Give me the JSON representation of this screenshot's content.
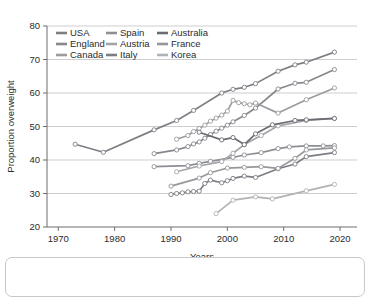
{
  "chart_data": {
    "type": "line",
    "title": "",
    "xlabel": "Years",
    "ylabel": "Proportion overweight",
    "xlim": [
      1968,
      2023
    ],
    "ylim": [
      20,
      80
    ],
    "xticks": [
      1970,
      1980,
      1990,
      2000,
      2010,
      2020
    ],
    "yticks": [
      20,
      30,
      40,
      50,
      60,
      70,
      80
    ],
    "grid": "horizontal",
    "legend_position": "top-left-inside",
    "legend_columns": 3,
    "series": [
      {
        "name": "USA",
        "color": "#7d7f84",
        "x": [
          1973,
          1978,
          1987,
          1991,
          1994,
          1999,
          2001,
          2003,
          2005,
          2009,
          2012,
          2014,
          2019
        ],
        "y": [
          44.7,
          42.3,
          49.0,
          51.8,
          54.8,
          60.0,
          61.1,
          61.7,
          62.8,
          66.5,
          68.4,
          69.2,
          72.2
        ]
      },
      {
        "name": "England",
        "color": "#86888d",
        "x": [
          1987,
          1991,
          1993,
          1994,
          1995,
          1996,
          1997,
          1998,
          1999,
          2000,
          2001,
          2003,
          2005,
          2009,
          2012,
          2014,
          2019
        ],
        "y": [
          41.9,
          43.0,
          44.0,
          44.8,
          45.4,
          46.5,
          47.6,
          48.6,
          49.5,
          50.4,
          51.4,
          53.3,
          55.5,
          61.2,
          62.9,
          63.2,
          67.0
        ]
      },
      {
        "name": "Canada",
        "color": "#9a9ca0",
        "x": [
          1991,
          1993,
          1994,
          1995,
          1996,
          1997,
          1998,
          1999,
          2000,
          2001,
          2002,
          2003,
          2004,
          2005,
          2009,
          2014,
          2019
        ],
        "y": [
          46.2,
          47.3,
          48.5,
          49.4,
          50.4,
          51.6,
          52.5,
          53.4,
          54.6,
          57.8,
          57.1,
          56.8,
          56.5,
          57.0,
          54.0,
          58.0,
          61.5
        ]
      },
      {
        "name": "Spain",
        "color": "#8d8f94",
        "x": [
          1987,
          1993,
          1995,
          1997,
          2001,
          2003,
          2006,
          2009,
          2011,
          2014,
          2017,
          2019
        ],
        "y": [
          38.0,
          38.3,
          39.0,
          39.6,
          40.8,
          41.5,
          42.2,
          43.4,
          43.9,
          44.2,
          44.2,
          44.3
        ]
      },
      {
        "name": "Austria",
        "color": "#a2a4a8",
        "x": [
          1991,
          1995,
          1999,
          2001,
          2003,
          2006,
          2009,
          2014,
          2019
        ],
        "y": [
          36.5,
          38.2,
          39.5,
          42.0,
          44.6,
          47.3,
          50.2,
          51.8,
          52.4
        ]
      },
      {
        "name": "Italy",
        "color": "#7b7d82",
        "x": [
          1990,
          1991,
          1992,
          1993,
          1994,
          1995,
          1996,
          1997,
          1999,
          2000,
          2001,
          2003,
          2005,
          2009,
          2012,
          2014,
          2019
        ],
        "y": [
          29.7,
          30.0,
          30.2,
          30.5,
          30.6,
          30.7,
          33.0,
          34.0,
          33.2,
          33.8,
          34.5,
          35.2,
          34.8,
          37.4,
          38.8,
          41.0,
          42.2
        ]
      },
      {
        "name": "Australia",
        "color": "#6a6c71",
        "x": [
          1995,
          1999,
          2001,
          2003,
          2005,
          2008,
          2012,
          2014,
          2019
        ],
        "y": [
          48.3,
          46.0,
          46.7,
          44.6,
          47.8,
          50.5,
          51.8,
          52.0,
          52.4
        ]
      },
      {
        "name": "France",
        "color": "#95979b",
        "x": [
          1990,
          1995,
          1997,
          2000,
          2003,
          2006,
          2009,
          2012,
          2014,
          2019
        ],
        "y": [
          32.2,
          34.6,
          36.2,
          37.6,
          37.8,
          38.0,
          37.5,
          40.5,
          43.0,
          43.6
        ]
      },
      {
        "name": "Korea",
        "color": "#b0b2b6",
        "x": [
          1998,
          2001,
          2005,
          2008,
          2014,
          2019
        ],
        "y": [
          24.0,
          28.0,
          29.0,
          28.4,
          30.8,
          32.7
        ]
      }
    ],
    "legend": [
      {
        "label": "USA",
        "color": "#7d7f84"
      },
      {
        "label": "Spain",
        "color": "#8d8f94"
      },
      {
        "label": "Australia",
        "color": "#6a6c71"
      },
      {
        "label": "England",
        "color": "#86888d"
      },
      {
        "label": "Austria",
        "color": "#a2a4a8"
      },
      {
        "label": "France",
        "color": "#95979b"
      },
      {
        "label": "Canada",
        "color": "#9a9ca0"
      },
      {
        "label": "Italy",
        "color": "#7b7d82"
      },
      {
        "label": "Korea",
        "color": "#b0b2b6"
      }
    ]
  },
  "colors": {
    "background": "#ffffff",
    "axis": "#6d6d6d",
    "grid": "#b9b9b9",
    "text": "#2b2b2b",
    "panel_border": "#c8c8c8"
  }
}
